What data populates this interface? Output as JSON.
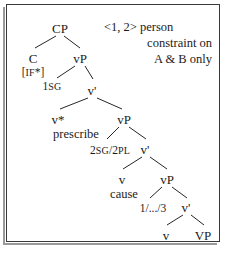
{
  "figure": {
    "type": "syntax-tree",
    "background_color": "#ffffff",
    "ink_color": "#1b1b1b",
    "frame_color": "#3a3a3a",
    "width": 229,
    "height": 253
  },
  "annotation": {
    "lines": [
      "<1, 2> person",
      "constraint on",
      "A & B only"
    ]
  },
  "tree": {
    "nodes": [
      {
        "id": "cp",
        "label": "CP",
        "x": 60,
        "y": 22
      },
      {
        "id": "c",
        "label": "C",
        "x": 33,
        "y": 52
      },
      {
        "id": "vp1",
        "label": "vP",
        "x": 80,
        "y": 52
      },
      {
        "id": "vbar1",
        "label": "v",
        "prime": "'",
        "x": 92,
        "y": 84
      },
      {
        "id": "vstar",
        "label": "v",
        "star": "*",
        "x": 58,
        "y": 113
      },
      {
        "id": "vp2",
        "label": "vP",
        "x": 124,
        "y": 113
      },
      {
        "id": "vbar2",
        "label": "v",
        "prime": "'",
        "x": 145,
        "y": 143
      },
      {
        "id": "v2",
        "label": "v",
        "x": 122,
        "y": 173
      },
      {
        "id": "vp3",
        "label": "vP",
        "x": 167,
        "y": 173
      },
      {
        "id": "vbar3",
        "label": "v",
        "prime": "'",
        "x": 186,
        "y": 201
      },
      {
        "id": "v3",
        "label": "v",
        "x": 166,
        "y": 229
      },
      {
        "id": "VP",
        "label": "VP",
        "x": 203,
        "y": 229
      }
    ],
    "features": [
      {
        "id": "if-star",
        "text": "[IF*]",
        "x": 33,
        "y": 67
      },
      {
        "id": "1sg",
        "text": "1SG",
        "sc_from": 1,
        "x": 52,
        "y": 81
      },
      {
        "id": "2sg2pl",
        "text": "2SG/2PL",
        "x": 110,
        "y": 145
      },
      {
        "id": "1to3",
        "text": "1/.../3",
        "x": 153,
        "y": 203
      }
    ],
    "lexical": [
      {
        "id": "prescribe",
        "text": "prescribe",
        "x": 76,
        "y": 128
      },
      {
        "id": "cause",
        "text": "cause",
        "x": 124,
        "y": 188
      }
    ],
    "edges": [
      {
        "from": "cp",
        "to": "c",
        "x1": 56,
        "y1": 36,
        "x2": 35,
        "y2": 48
      },
      {
        "from": "cp",
        "to": "vp1",
        "x1": 64,
        "y1": 36,
        "x2": 80,
        "y2": 48
      },
      {
        "from": "vp1",
        "to": "spec1",
        "x1": 75,
        "y1": 66,
        "x2": 57,
        "y2": 78
      },
      {
        "from": "vp1",
        "to": "vbar1",
        "x1": 85,
        "y1": 66,
        "x2": 93,
        "y2": 79
      },
      {
        "from": "vbar1",
        "to": "vstar",
        "x1": 88,
        "y1": 98,
        "x2": 60,
        "y2": 109
      },
      {
        "from": "vbar1",
        "to": "vp2",
        "x1": 97,
        "y1": 98,
        "x2": 122,
        "y2": 109
      },
      {
        "from": "vp2",
        "to": "spec2",
        "x1": 119,
        "y1": 127,
        "x2": 107,
        "y2": 139
      },
      {
        "from": "vp2",
        "to": "vbar2",
        "x1": 129,
        "y1": 127,
        "x2": 146,
        "y2": 139
      },
      {
        "from": "vbar2",
        "to": "v2",
        "x1": 142,
        "y1": 157,
        "x2": 123,
        "y2": 169
      },
      {
        "from": "vbar2",
        "to": "vp3",
        "x1": 150,
        "y1": 157,
        "x2": 167,
        "y2": 169
      },
      {
        "from": "vp3",
        "to": "spec3",
        "x1": 162,
        "y1": 187,
        "x2": 150,
        "y2": 198
      },
      {
        "from": "vp3",
        "to": "vbar3",
        "x1": 172,
        "y1": 187,
        "x2": 187,
        "y2": 198
      },
      {
        "from": "vbar3",
        "to": "v3",
        "x1": 183,
        "y1": 215,
        "x2": 167,
        "y2": 225
      },
      {
        "from": "vbar3",
        "to": "VP",
        "x1": 191,
        "y1": 215,
        "x2": 204,
        "y2": 225
      }
    ]
  }
}
